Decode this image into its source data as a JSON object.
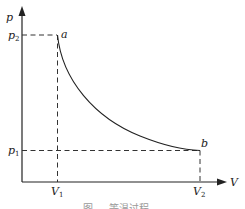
{
  "diagram": {
    "type": "p-V diagram",
    "axes": {
      "y_label": "p",
      "x_label": "V"
    },
    "ticks": {
      "p2": {
        "base": "p",
        "sub": "2"
      },
      "p1": {
        "base": "p",
        "sub": "1"
      },
      "V1": {
        "base": "V",
        "sub": "1"
      },
      "V2": {
        "base": "V",
        "sub": "2"
      }
    },
    "points": {
      "a": "a",
      "b": "b"
    },
    "curve": "hyperbolic process from a (V1, p2) to b (V2, p1)",
    "caption": "图 … 等温过程"
  }
}
